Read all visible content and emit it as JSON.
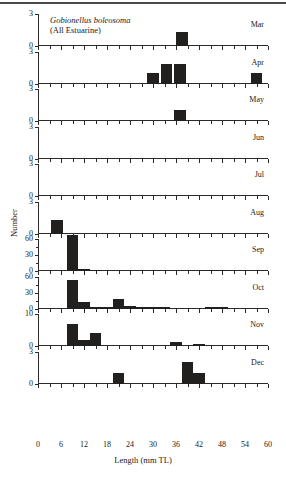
{
  "chart_data": {
    "type": "bar",
    "title": "Gobionellus boleosoma",
    "subtitle": "(All Estuarine)",
    "xlabel": "Length (mm TL)",
    "ylabel": "Number",
    "xlim": [
      0,
      60
    ],
    "xticks": [
      0,
      6,
      12,
      18,
      24,
      30,
      36,
      42,
      48,
      54,
      60
    ],
    "xtick_labels": [
      "0",
      "6",
      "12",
      "18",
      "24",
      "30",
      "36",
      "42",
      "48",
      "54",
      "60"
    ],
    "minor_tick_step": 3,
    "grid": false,
    "legend": "none",
    "bar_width_mm": 3,
    "panels": [
      {
        "label": "Mar",
        "ylim": [
          0,
          3
        ],
        "yticks": [
          0,
          3
        ],
        "ytick_labels": [
          "0",
          "3"
        ],
        "x": [
          37.5
        ],
        "values": [
          1.3
        ]
      },
      {
        "label": "Apr",
        "ylim": [
          0,
          3
        ],
        "yticks": [
          0,
          3
        ],
        "ytick_labels": [
          "0",
          "3"
        ],
        "x": [
          30,
          33.5,
          37
        ],
        "values": [
          1.0,
          1.8,
          1.8
        ],
        "extra_x": [
          57
        ],
        "extra_values": [
          1.0
        ]
      },
      {
        "label": "May",
        "ylim": [
          0,
          3
        ],
        "yticks": [
          0,
          3
        ],
        "ytick_labels": [
          "0",
          "3"
        ],
        "x": [
          37
        ],
        "values": [
          1.0
        ]
      },
      {
        "label": "Jun",
        "ylim": [
          0,
          3
        ],
        "yticks": [
          0,
          3
        ],
        "ytick_labels": [
          "0",
          "3"
        ],
        "x": [],
        "values": []
      },
      {
        "label": "Jul",
        "ylim": [
          0,
          3
        ],
        "yticks": [
          0,
          3
        ],
        "ytick_labels": [
          "0",
          "3"
        ],
        "x": [],
        "values": []
      },
      {
        "label": "Aug",
        "ylim": [
          0,
          3
        ],
        "yticks": [
          0,
          3
        ],
        "ytick_labels": [
          "0",
          "3"
        ],
        "x": [
          5
        ],
        "values": [
          1.3
        ]
      },
      {
        "label": "Sep",
        "ylim": [
          0,
          60
        ],
        "yticks": [
          0,
          30,
          60
        ],
        "ytick_labels": [
          "0",
          "30",
          "60"
        ],
        "x": [
          9,
          12,
          15,
          45,
          48
        ],
        "values": [
          67,
          4,
          1,
          1,
          1
        ]
      },
      {
        "label": "Oct",
        "ylim": [
          0,
          60
        ],
        "yticks": [
          0,
          30,
          60
        ],
        "ytick_labels": [
          "0",
          "30",
          "60"
        ],
        "x": [
          9,
          12,
          15,
          18,
          21,
          24,
          27,
          30,
          33,
          45,
          48
        ],
        "values": [
          53,
          12,
          2,
          2,
          17,
          5,
          3,
          1,
          2,
          1,
          1
        ]
      },
      {
        "label": "Nov",
        "ylim": [
          0,
          10
        ],
        "yticks": [
          0,
          10
        ],
        "ytick_labels": [
          "0",
          "10"
        ],
        "x": [
          9,
          12,
          15,
          36,
          42
        ],
        "values": [
          7,
          2,
          4,
          1.2,
          0.5
        ]
      },
      {
        "label": "Dec",
        "ylim": [
          0,
          3
        ],
        "yticks": [
          0,
          3
        ],
        "ytick_labels": [
          "0",
          "3"
        ],
        "x": [
          21,
          39,
          42
        ],
        "values": [
          1.0,
          2.0,
          1.0
        ]
      }
    ]
  }
}
